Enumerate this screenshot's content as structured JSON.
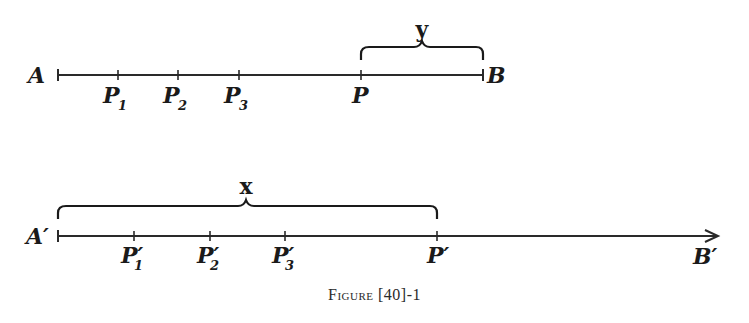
{
  "diagram": {
    "top_line": {
      "start_label": "A",
      "end_label": "B",
      "points": [
        {
          "label": "P",
          "sub": "1",
          "x": 118
        },
        {
          "label": "P",
          "sub": "2",
          "x": 178
        },
        {
          "label": "P",
          "sub": "3",
          "x": 239
        },
        {
          "label": "P",
          "sub": "",
          "x": 361
        }
      ],
      "brace_label": "y"
    },
    "bottom_line": {
      "start_label": "A′",
      "end_label": "B′",
      "points": [
        {
          "label": "P′",
          "sub": "1",
          "x": 134
        },
        {
          "label": "P′",
          "sub": "2",
          "x": 210
        },
        {
          "label": "P′",
          "sub": "3",
          "x": 285
        },
        {
          "label": "P′",
          "sub": "",
          "x": 437
        }
      ],
      "brace_label": "x"
    }
  },
  "caption": {
    "word": "Figure",
    "number": "[40]-1"
  }
}
